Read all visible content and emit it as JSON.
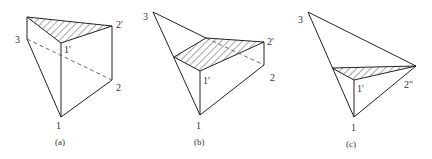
{
  "figures": [
    {
      "id": "a",
      "caption": "(a)",
      "labels": {
        "p1": "1",
        "p2": "2",
        "p3": "3",
        "p1p": "1'",
        "p2p": "2'"
      }
    },
    {
      "id": "b",
      "caption": "(b)",
      "labels": {
        "p1": "1",
        "p2": "2",
        "p3": "3",
        "p1p": "1'",
        "p2p": "2'"
      }
    },
    {
      "id": "c",
      "caption": "(c)",
      "labels": {
        "p1": "1",
        "p3": "3",
        "p1p": "1'",
        "p2pp": "2\""
      }
    }
  ],
  "colors": {
    "line": "#222222",
    "text": "#333333",
    "background": "#ffffff"
  }
}
